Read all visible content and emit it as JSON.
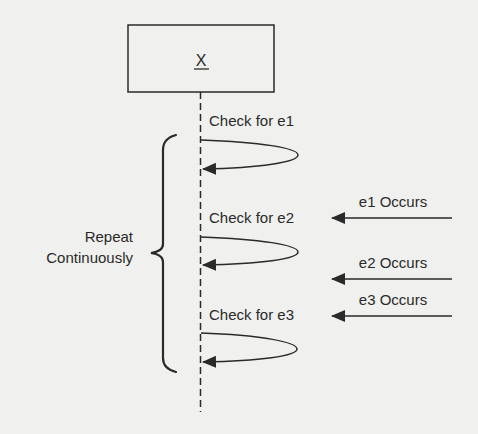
{
  "diagram": {
    "object": {
      "name": "X"
    },
    "repeat_label": {
      "line1": "Repeat",
      "line2": "Continuously"
    },
    "checks": [
      {
        "label": "Check for e1"
      },
      {
        "label": "Check for e2"
      },
      {
        "label": "Check for e3"
      }
    ],
    "events": [
      {
        "label": "e1 Occurs"
      },
      {
        "label": "e2 Occurs"
      },
      {
        "label": "e3 Occurs"
      }
    ],
    "colors": {
      "stroke": "#2a2a2a",
      "background": "#f0f0ee"
    }
  }
}
